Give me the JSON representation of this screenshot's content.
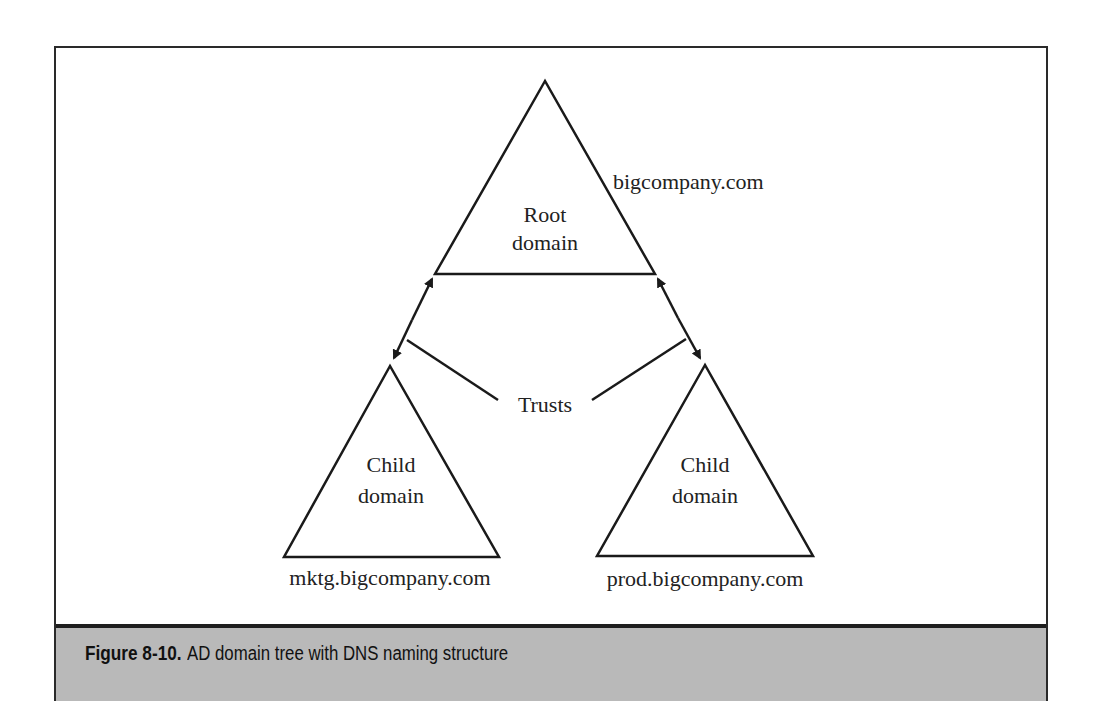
{
  "figure": {
    "label": "Figure 8-10.",
    "caption": "AD domain tree with DNS naming structure"
  },
  "diagram": {
    "root": {
      "title_line1": "Root",
      "title_line2": "domain",
      "dns_name": "bigcompany.com"
    },
    "children": [
      {
        "title_line1": "Child",
        "title_line2": "domain",
        "dns_name": "mktg.bigcompany.com"
      },
      {
        "title_line1": "Child",
        "title_line2": "domain",
        "dns_name": "prod.bigcompany.com"
      }
    ],
    "relationship_label": "Trusts"
  },
  "colors": {
    "line": "#1a1a1a",
    "caption_band": "#b9b9b9",
    "frame": "#2a2a2a"
  }
}
